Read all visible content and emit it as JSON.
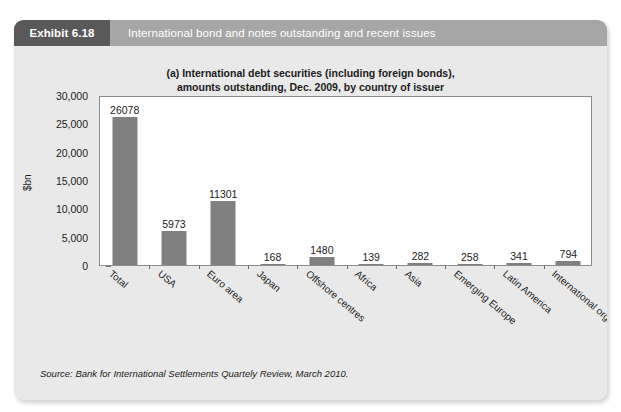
{
  "exhibit": {
    "tag": "Exhibit 6.18",
    "header_title": "International bond and notes outstanding and recent issues",
    "source": "Source: Bank for International Settlements Quartely Review, March 2010.",
    "tag_bg": "#595959",
    "header_bg": "#a6a6a6",
    "card_bg": "#e9e9e9"
  },
  "chart_data": {
    "type": "bar",
    "title": "(a) International debt securities (including foreign bonds), amounts outstanding, Dec. 2009, by country of issuer",
    "title_line1": "(a) International debt securities (including foreign bonds),",
    "title_line2": "amounts outstanding, Dec. 2009, by country of issuer",
    "xlabel": "",
    "ylabel": "$bn",
    "ylim": [
      0,
      30000
    ],
    "ytick_values": [
      0,
      5000,
      10000,
      15000,
      20000,
      25000,
      30000
    ],
    "ytick_labels": [
      "0",
      "5,000",
      "10,000",
      "15,000",
      "20,000",
      "25,000",
      "30,000"
    ],
    "grid": false,
    "legend": false,
    "bar_color": "#808080",
    "categories": [
      "Total",
      "USA",
      "Euro area",
      "Japan",
      "Offshore centres",
      "Africa",
      "Asia",
      "Emerging Europe",
      "Latin America",
      "International organisations"
    ],
    "values": [
      26078,
      5973,
      11301,
      168,
      1480,
      139,
      282,
      258,
      341,
      794
    ],
    "value_labels": [
      "26078",
      "5973",
      "11301",
      "168",
      "1480",
      "139",
      "282",
      "258",
      "341",
      "794"
    ]
  }
}
